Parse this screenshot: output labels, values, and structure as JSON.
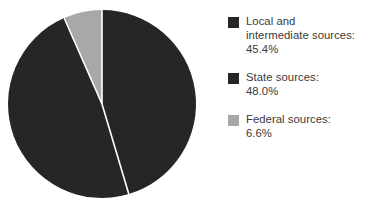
{
  "chart_data": {
    "type": "pie",
    "title": "",
    "subtitle": "",
    "xlabel": "",
    "ylabel": "",
    "grid": false,
    "legend_position": "right",
    "start_angle_deg": 0,
    "direction": "clockwise",
    "categories": [
      "Local and intermediate sources",
      "State sources",
      "Federal sources"
    ],
    "values": [
      45.4,
      48.0,
      6.6
    ],
    "value_unit": "percent",
    "slices": [
      {
        "label": "Local and intermediate sources",
        "value": 45.4,
        "value_text": "45.4%",
        "color": "#262626",
        "sweep_deg": 163.4
      },
      {
        "label": "State sources",
        "value": 48.0,
        "value_text": "48.0%",
        "color": "#262626",
        "sweep_deg": 172.8
      },
      {
        "label": "Federal sources",
        "value": 6.6,
        "value_text": "6.6%",
        "color": "#a8a8a8",
        "sweep_deg": 23.8
      }
    ],
    "separator_color": "#ffffff"
  },
  "legend": {
    "entries": [
      {
        "label": "Local and\nintermediate sources:\n45.4%",
        "swatch_color": "#262626",
        "swatch_name": "legend-swatch-local-and-intermediate-sources"
      },
      {
        "label": "State sources:\n48.0%",
        "swatch_color": "#262626",
        "swatch_name": "legend-swatch-state-sources"
      },
      {
        "label": "Federal sources:\n6.6%",
        "swatch_color": "#a8a8a8",
        "swatch_name": "legend-swatch-federal-sources"
      }
    ]
  },
  "colors": {
    "dark": "#262626",
    "gray": "#a8a8a8",
    "text": "#3a3a3a",
    "background": "#ffffff",
    "separator": "#ffffff"
  },
  "geometry": {
    "center_x": 102,
    "center_y": 104,
    "radius": 94
  }
}
